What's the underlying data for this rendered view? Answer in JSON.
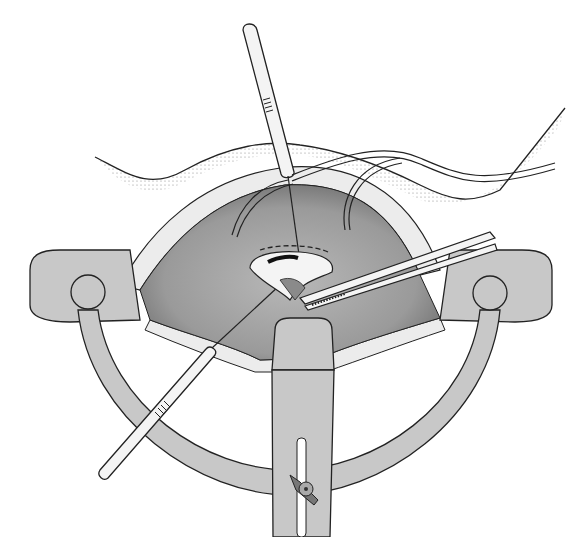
{
  "figure": {
    "type": "surgical-illustration",
    "colors": {
      "background": "#ffffff",
      "outline": "#222222",
      "retractor_gray": "#c8c8c8",
      "cavity_gray": "#a0a0a0",
      "cavity_dark": "#7a7a7a",
      "instrument_white": "#f4f4f4",
      "fat_layer": "#e6e6e6"
    },
    "elements": [
      "skin-surface",
      "fat-layer",
      "surgical-cavity",
      "self-retaining-retractor-ring",
      "retractor-center-blade",
      "wing-nut",
      "upper-needle-holder",
      "lower-needle-holder",
      "forceps",
      "drain-tubes",
      "orifice-with-dashed-incision"
    ]
  }
}
